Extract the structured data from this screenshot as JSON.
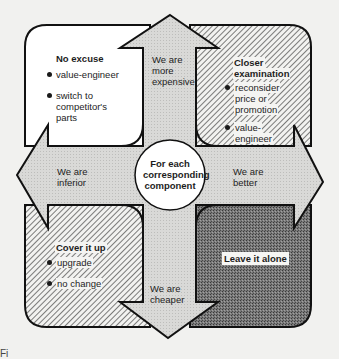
{
  "diagram": {
    "center": {
      "lines": [
        "For each",
        "corresponding",
        "component"
      ]
    },
    "arrows": {
      "up": {
        "lines": [
          "We are",
          "more",
          "expensive"
        ]
      },
      "down": {
        "lines": [
          "We are",
          "cheaper"
        ]
      },
      "left": {
        "lines": [
          "We are",
          "inferior"
        ]
      },
      "right": {
        "lines": [
          "We are",
          "better"
        ]
      }
    },
    "quadrants": {
      "top_left": {
        "title": "No excuse",
        "fill": "white",
        "bullets": [
          {
            "lines": [
              "value-engineer"
            ]
          },
          {
            "lines": [
              "switch to",
              "competitor's",
              "parts"
            ]
          }
        ]
      },
      "top_right": {
        "title_lines": [
          "Closer",
          "examination"
        ],
        "fill": "diagonal-hatch",
        "bullets": [
          {
            "lines": [
              "reconsider",
              "price or",
              "promotion"
            ]
          },
          {
            "lines": [
              "value-",
              "engineer"
            ]
          }
        ]
      },
      "bottom_left": {
        "title": "Cover  it up",
        "fill": "diagonal-hatch",
        "bullets": [
          {
            "lines": [
              "upgrade"
            ]
          },
          {
            "lines": [
              "no change"
            ]
          }
        ]
      },
      "bottom_right": {
        "title": "Leave it alone",
        "fill": "dark-stipple"
      }
    },
    "colors": {
      "background": "#f1f1ef",
      "arrow_fill": "#d6d6d4",
      "outline": "#111111",
      "dark_fill": "#6e6e6e",
      "hatch_line": "#3a3a3a",
      "white_fill": "#ffffff"
    },
    "caption_partial": "Fi"
  }
}
